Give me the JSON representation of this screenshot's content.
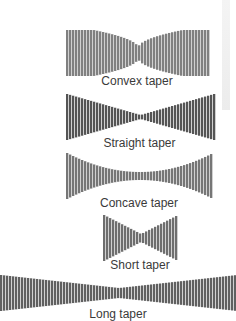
{
  "colors": {
    "dark": "#555555",
    "mid": "#7a7a7a",
    "light": "#c8c8c8",
    "label": "#3a3a3a"
  },
  "tapers": [
    {
      "id": "convex",
      "label": "Convex taper",
      "x0": 66,
      "x1": 208,
      "cy": 53,
      "maxH": 46,
      "minH": 10,
      "shape": "convex",
      "fill": "#808080",
      "label_y": 74
    },
    {
      "id": "straight",
      "label": "Straight taper",
      "x0": 66,
      "x1": 213,
      "cy": 117,
      "maxH": 46,
      "minH": 4,
      "shape": "straight",
      "fill": "#555555",
      "label_y": 136
    },
    {
      "id": "concave",
      "label": "Concave taper",
      "x0": 66,
      "x1": 212,
      "cy": 176,
      "maxH": 46,
      "minH": 8,
      "shape": "concave",
      "fill": "#767676",
      "label_y": 196
    },
    {
      "id": "short",
      "label": "Short taper",
      "x0": 103,
      "x1": 177,
      "cy": 238,
      "maxH": 46,
      "minH": 8,
      "shape": "straight",
      "fill": "#6e6e6e",
      "label_y": 258
    },
    {
      "id": "long",
      "label": "Long taper",
      "x0": 0,
      "x1": 236,
      "cy": 293,
      "maxH": 36,
      "minH": 10,
      "shape": "straight",
      "fill": "#606060",
      "label_y": 307
    }
  ]
}
